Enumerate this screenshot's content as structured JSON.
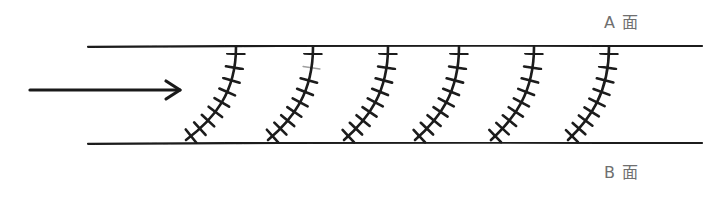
{
  "figure": {
    "type": "hand-drawn-schematic",
    "background_color": "#ffffff",
    "ink_color": "#1a1a1a",
    "label_color": "#6f6f6f",
    "width": 712,
    "height": 197
  },
  "labels": {
    "top_surface": "A 面",
    "bottom_surface": "B 面"
  },
  "flow_arrow": {
    "name": "flow-direction-arrow",
    "direction": "right",
    "x_start": 30,
    "x_end": 180,
    "y": 90,
    "head_length": 14,
    "head_spread": 9,
    "stroke_width": 3.2
  },
  "boundaries": [
    {
      "name": "top-boundary-line",
      "label_ref": "A 面",
      "x_start": 88,
      "x_end": 702,
      "y": 46,
      "stroke_width": 2.2
    },
    {
      "name": "bottom-boundary-line",
      "label_ref": "B 面",
      "x_start": 88,
      "x_end": 702,
      "y": 143,
      "stroke_width": 2.2
    }
  ],
  "curves": [
    {
      "name": "marker-curve-1",
      "index": 1,
      "top_x": 236,
      "top_y": 47,
      "bottom_x": 186,
      "bottom_y": 140,
      "ctrl1_x": 236,
      "ctrl1_y": 93,
      "ctrl2_x": 214,
      "ctrl2_y": 119,
      "tick_count": 9,
      "tick_length": 17,
      "faded_tick_index": null
    },
    {
      "name": "marker-curve-2",
      "index": 2,
      "top_x": 313,
      "top_y": 47,
      "bottom_x": 268,
      "bottom_y": 140,
      "ctrl1_x": 313,
      "ctrl1_y": 93,
      "ctrl2_x": 293,
      "ctrl2_y": 119,
      "tick_count": 9,
      "tick_length": 17,
      "faded_tick_index": 1
    },
    {
      "name": "marker-curve-3",
      "index": 3,
      "top_x": 388,
      "top_y": 47,
      "bottom_x": 344,
      "bottom_y": 140,
      "ctrl1_x": 388,
      "ctrl1_y": 93,
      "ctrl2_x": 368,
      "ctrl2_y": 119,
      "tick_count": 9,
      "tick_length": 17,
      "faded_tick_index": null
    },
    {
      "name": "marker-curve-4",
      "index": 4,
      "top_x": 459,
      "top_y": 47,
      "bottom_x": 415,
      "bottom_y": 140,
      "ctrl1_x": 459,
      "ctrl1_y": 93,
      "ctrl2_x": 439,
      "ctrl2_y": 119,
      "tick_count": 9,
      "tick_length": 17,
      "faded_tick_index": null
    },
    {
      "name": "marker-curve-5",
      "index": 5,
      "top_x": 534,
      "top_y": 47,
      "bottom_x": 491,
      "bottom_y": 140,
      "ctrl1_x": 534,
      "ctrl1_y": 93,
      "ctrl2_x": 514,
      "ctrl2_y": 119,
      "tick_count": 9,
      "tick_length": 17,
      "faded_tick_index": null
    },
    {
      "name": "marker-curve-6",
      "index": 6,
      "top_x": 609,
      "top_y": 47,
      "bottom_x": 568,
      "bottom_y": 140,
      "ctrl1_x": 609,
      "ctrl1_y": 93,
      "ctrl2_x": 590,
      "ctrl2_y": 119,
      "tick_count": 9,
      "tick_length": 17,
      "faded_tick_index": null
    }
  ]
}
